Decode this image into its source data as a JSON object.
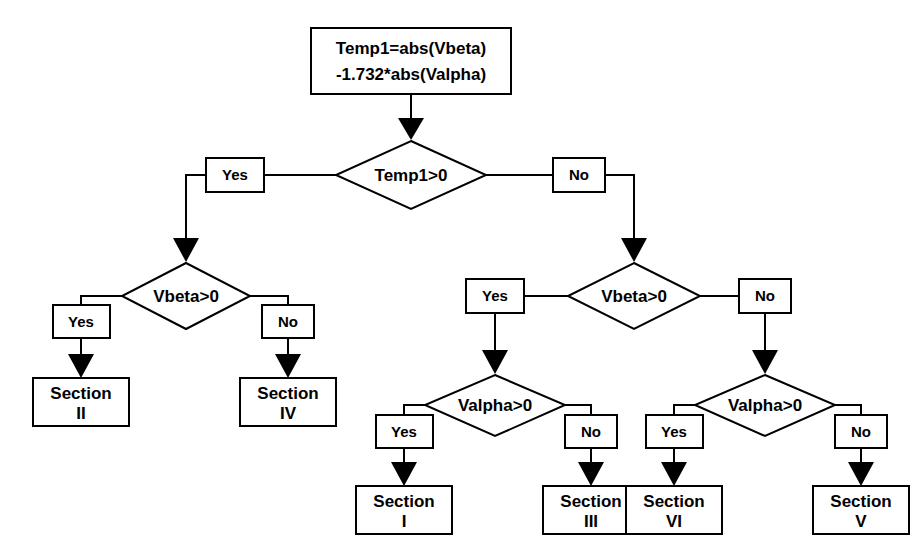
{
  "diagram": {
    "colors": {
      "background": "#ffffff",
      "stroke": "#000000",
      "fill": "#ffffff",
      "arrow": "#000000"
    },
    "start": {
      "line1": "Temp1=abs(Vbeta)",
      "line2": "-1.732*abs(Valpha)"
    },
    "decisions": {
      "root": "Temp1>0",
      "left_vbeta": "Vbeta>0",
      "right_vbeta": "Vbeta>0",
      "left_valpha": "Valpha>0",
      "right_valpha": "Valpha>0"
    },
    "labels": {
      "root_yes": "Yes",
      "root_no": "No",
      "left_vbeta_yes": "Yes",
      "left_vbeta_no": "No",
      "right_vbeta_yes": "Yes",
      "right_vbeta_no": "No",
      "left_valpha_yes": "Yes",
      "left_valpha_no": "No",
      "right_valpha_yes": "Yes",
      "right_valpha_no": "No"
    },
    "terminals": {
      "section_ii": {
        "line1": "Section",
        "line2": "II"
      },
      "section_iv": {
        "line1": "Section",
        "line2": "IV"
      },
      "section_i": {
        "line1": "Section",
        "line2": "I"
      },
      "section_iii": {
        "line1": "Section",
        "line2": "III"
      },
      "section_vi": {
        "line1": "Section",
        "line2": "VI"
      },
      "section_v": {
        "line1": "Section",
        "line2": "V"
      }
    }
  }
}
